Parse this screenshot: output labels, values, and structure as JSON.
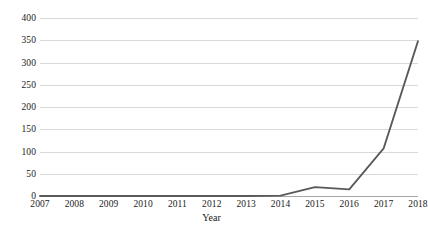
{
  "chart_data": {
    "type": "line",
    "title": "",
    "xlabel": "Year",
    "ylabel": "",
    "categories": [
      "2007",
      "2008",
      "2009",
      "2010",
      "2011",
      "2012",
      "2013",
      "2014",
      "2015",
      "2016",
      "2017",
      "2018"
    ],
    "values": [
      0,
      0,
      0,
      0,
      0,
      0,
      0,
      1,
      20,
      15,
      107,
      348
    ],
    "series": [
      {
        "name": "",
        "values": [
          0,
          0,
          0,
          0,
          0,
          0,
          0,
          1,
          20,
          15,
          107,
          348
        ],
        "color": "#595959"
      }
    ],
    "ylim": [
      0,
      400
    ],
    "ytick_labels": [
      "0",
      "50",
      "100",
      "150",
      "200",
      "250",
      "300",
      "350",
      "400"
    ],
    "ytick_values": [
      0,
      50,
      100,
      150,
      200,
      250,
      300,
      350,
      400
    ],
    "grid": true,
    "grid_color": "#d9d9d9",
    "axis_color": "#a6a6a6",
    "legend": "none"
  },
  "caption": ""
}
